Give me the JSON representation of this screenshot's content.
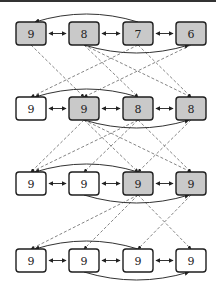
{
  "diagram": {
    "title": "",
    "colors": {
      "filled": "#c9c9c9",
      "empty": "#ffffff",
      "border": "#1e1e1e",
      "edge": "#333333",
      "dashed": "#666666"
    },
    "layout": {
      "node_width": 30,
      "node_height": 23,
      "columns_x": [
        16,
        69,
        123,
        176
      ],
      "rows_y": [
        22,
        97,
        172,
        249
      ]
    },
    "rows": [
      {
        "nodes": [
          {
            "label": "9",
            "filled": true
          },
          {
            "label": "8",
            "filled": true
          },
          {
            "label": "7",
            "filled": true
          },
          {
            "label": "6",
            "filled": true
          }
        ],
        "arc_over": {
          "from": 2,
          "to": 0
        },
        "arc_under": {
          "from": 1,
          "to": 3
        }
      },
      {
        "nodes": [
          {
            "label": "9",
            "filled": false
          },
          {
            "label": "9",
            "filled": true
          },
          {
            "label": "8",
            "filled": true
          },
          {
            "label": "8",
            "filled": true
          }
        ],
        "arc_over": {
          "from": 2,
          "to": 0
        },
        "arc_under": {
          "from": 1,
          "to": 3
        }
      },
      {
        "nodes": [
          {
            "label": "9",
            "filled": false
          },
          {
            "label": "9",
            "filled": false
          },
          {
            "label": "9",
            "filled": true
          },
          {
            "label": "9",
            "filled": true
          }
        ],
        "arc_over": {
          "from": 2,
          "to": 0
        },
        "arc_under": {
          "from": 1,
          "to": 3
        }
      },
      {
        "nodes": [
          {
            "label": "9",
            "filled": false
          },
          {
            "label": "9",
            "filled": false
          },
          {
            "label": "9",
            "filled": false
          },
          {
            "label": "9",
            "filled": false
          }
        ],
        "arc_over": {
          "from": 2,
          "to": 0
        },
        "arc_under": {
          "from": 1,
          "to": 3
        }
      }
    ],
    "dashed_edges": [
      [
        [
          0,
          0
        ],
        [
          1,
          1
        ]
      ],
      [
        [
          0,
          1
        ],
        [
          1,
          2
        ]
      ],
      [
        [
          0,
          1
        ],
        [
          1,
          3
        ]
      ],
      [
        [
          0,
          2
        ],
        [
          1,
          0
        ]
      ],
      [
        [
          0,
          2
        ],
        [
          1,
          3
        ]
      ],
      [
        [
          0,
          3
        ],
        [
          1,
          1
        ]
      ],
      [
        [
          1,
          1
        ],
        [
          2,
          0
        ]
      ],
      [
        [
          1,
          1
        ],
        [
          2,
          2
        ]
      ],
      [
        [
          1,
          1
        ],
        [
          2,
          3
        ]
      ],
      [
        [
          1,
          2
        ],
        [
          2,
          0
        ]
      ],
      [
        [
          1,
          2
        ],
        [
          2,
          1
        ]
      ],
      [
        [
          1,
          2
        ],
        [
          2,
          3
        ]
      ],
      [
        [
          1,
          3
        ],
        [
          2,
          2
        ]
      ],
      [
        [
          2,
          2
        ],
        [
          3,
          0
        ]
      ],
      [
        [
          2,
          2
        ],
        [
          3,
          1
        ]
      ],
      [
        [
          2,
          2
        ],
        [
          3,
          3
        ]
      ],
      [
        [
          2,
          3
        ],
        [
          3,
          2
        ]
      ]
    ]
  }
}
